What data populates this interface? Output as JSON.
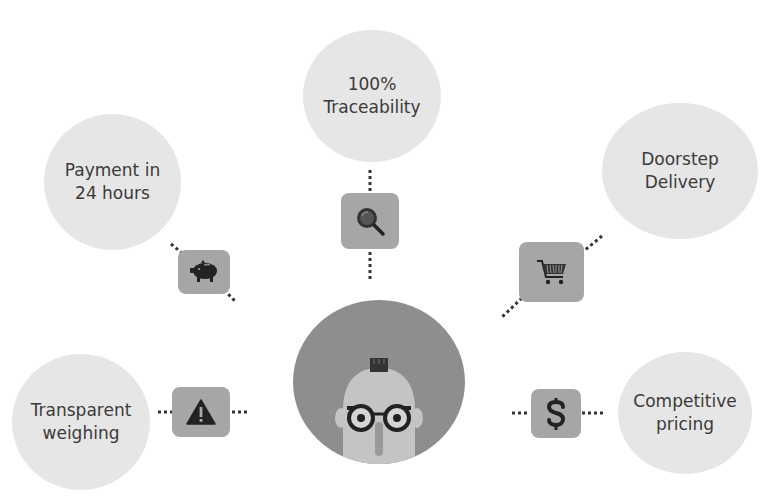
{
  "diagram": {
    "center": {
      "icon": "bald-man-with-glasses-avatar"
    },
    "features": [
      {
        "id": "traceability",
        "line1": "100%",
        "line2": "Traceability",
        "icon": "magnifier-icon"
      },
      {
        "id": "payment",
        "line1": "Payment in",
        "line2": "24 hours",
        "icon": "piggy-bank-icon"
      },
      {
        "id": "delivery",
        "line1": "Doorstep",
        "line2": "Delivery",
        "icon": "shopping-cart-icon"
      },
      {
        "id": "weighing",
        "line1": "Transparent",
        "line2": "weighing",
        "icon": "warning-icon"
      },
      {
        "id": "pricing",
        "line1": "Competitive",
        "line2": "pricing",
        "icon": "dollar-icon"
      }
    ],
    "colors": {
      "bubble": "#e6e6e6",
      "icon_box": "#a6a6a6",
      "hub": "#8e8e8e",
      "text": "#3a3a3a",
      "dots": "#333333"
    }
  }
}
